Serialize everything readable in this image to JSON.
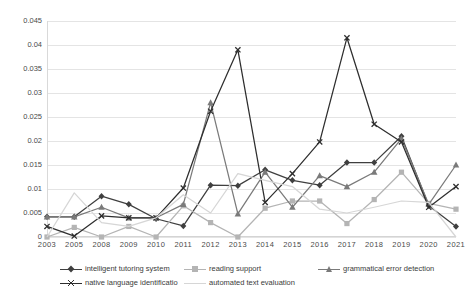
{
  "chart_data": {
    "type": "line",
    "title": "",
    "subtitle": "",
    "xlabel": "",
    "ylabel": "",
    "ylim": [
      0,
      0.045
    ],
    "grid": true,
    "legend_position": "bottom",
    "categories": [
      "2003",
      "2005",
      "2008",
      "2009",
      "2010",
      "2011",
      "2012",
      "2013",
      "2014",
      "2015",
      "2016",
      "2017",
      "2018",
      "2019",
      "2020",
      "2021"
    ],
    "ytick_labels": [
      "0",
      "0.005",
      "0.01",
      "0.015",
      "0.02",
      "0.025",
      "0.03",
      "0.035",
      "0.04",
      "0.045"
    ],
    "ytick_values": [
      0,
      0.005,
      0.01,
      0.015,
      0.02,
      0.025,
      0.03,
      0.035,
      0.04,
      0.045
    ],
    "series": [
      {
        "name": "intelligent tutoring system",
        "color": "#3f3f3f",
        "marker": "diamond",
        "values": [
          0.0042,
          0.0042,
          0.0085,
          0.0068,
          0.0038,
          0.0023,
          0.0108,
          0.0107,
          0.014,
          0.0118,
          0.0108,
          0.0155,
          0.0155,
          0.021,
          0.0065,
          0.0022
        ]
      },
      {
        "name": "reading support",
        "color": "#b4b4b4",
        "marker": "square",
        "values": [
          0.0,
          0.002,
          0.0,
          0.0022,
          0.0,
          0.0065,
          0.003,
          0.0,
          0.006,
          0.0075,
          0.0075,
          0.0028,
          0.0078,
          0.0135,
          0.007,
          0.0058
        ]
      },
      {
        "name": "grammatical error detection",
        "color": "#7a7a7a",
        "marker": "triangle",
        "values": [
          0.0042,
          0.0042,
          0.0062,
          0.004,
          0.004,
          0.0068,
          0.028,
          0.0048,
          0.0135,
          0.0062,
          0.0128,
          0.0105,
          0.0135,
          0.0205,
          0.0068,
          0.015
        ]
      },
      {
        "name": "native language identificatio",
        "color": "#2e2e2e",
        "marker": "cross",
        "values": [
          0.0022,
          0.0002,
          0.0044,
          0.004,
          0.004,
          0.0102,
          0.0262,
          0.039,
          0.0072,
          0.0132,
          0.0198,
          0.0415,
          0.0235,
          0.0198,
          0.0062,
          0.0105
        ]
      },
      {
        "name": "automated text evaluation",
        "color": "#d6d6d6",
        "marker": "none",
        "values": [
          0.0,
          0.0092,
          0.003,
          0.0022,
          0.004,
          0.0088,
          0.005,
          0.0132,
          0.0118,
          0.0105,
          0.0058,
          0.005,
          0.0062,
          0.0075,
          0.0072,
          0.0
        ]
      }
    ]
  }
}
